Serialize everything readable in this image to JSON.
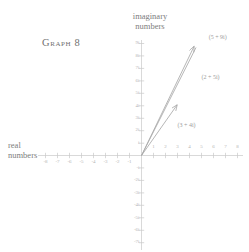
{
  "graph": {
    "title": "Graph 8",
    "imaginary_axis_label_line1": "imaginary",
    "imaginary_axis_label_line2": "numbers",
    "real_axis_label_line1": "real",
    "real_axis_label_line2": "numbers",
    "line_color": "#a9a9a9",
    "axis_color": "#cfcfcf",
    "tick_label_color": "#b4b4b4",
    "text_color": "#8a8a8a",
    "background": "#ffffff"
  },
  "chart_data": {
    "type": "scatter",
    "title": "Graph 8",
    "xlabel": "real numbers",
    "ylabel": "imaginary numbers",
    "xlim": [
      -9,
      9
    ],
    "ylim": [
      -8,
      10
    ],
    "grid": false,
    "legend": "none",
    "x_tick_labels": [
      "-8",
      "-7",
      "-6",
      "-5",
      "-4",
      "-3",
      "-2",
      "-1",
      "1",
      "2",
      "3",
      "4",
      "5",
      "6",
      "7",
      "8"
    ],
    "x_tick_values": [
      -8,
      -7,
      -6,
      -5,
      -4,
      -3,
      -2,
      -1,
      1,
      2,
      3,
      4,
      5,
      6,
      7,
      8
    ],
    "y_tick_labels": [
      "9i",
      "8i",
      "7i",
      "6i",
      "5i",
      "4i",
      "3i",
      "2i",
      "i",
      "-i",
      "-2i",
      "-3i",
      "-4i",
      "-5i",
      "-6i",
      "-7i"
    ],
    "y_tick_values": [
      9,
      8,
      7,
      6,
      5,
      4,
      3,
      2,
      1,
      -1,
      -2,
      -3,
      -4,
      -5,
      -6,
      -7
    ],
    "vectors": [
      {
        "name": "vector-3-plus-4i",
        "label": "(3 + 4i)",
        "from": [
          0,
          0
        ],
        "to": [
          3,
          4
        ],
        "label_x": 3.0,
        "label_y": 2.4
      },
      {
        "name": "vector-2-plus-5i",
        "label": "(2 + 5i)",
        "from": [
          0,
          0
        ],
        "to": [
          5,
          9
        ],
        "label_x": 5.0,
        "label_y": 6.2
      },
      {
        "name": "vector-5-plus-9i",
        "label": "(5 + 9i)",
        "from": [
          0,
          0
        ],
        "to": [
          5,
          9
        ],
        "label_x": 5.6,
        "label_y": 9.4
      }
    ],
    "annotations": [
      "(3 + 4i)",
      "(2 + 5i)",
      "(5 + 9i)"
    ]
  }
}
